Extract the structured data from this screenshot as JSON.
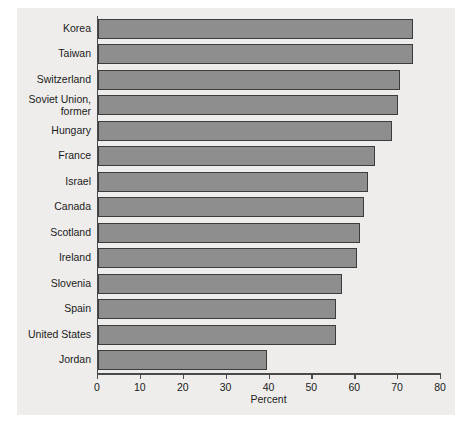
{
  "chart_data": {
    "type": "bar",
    "orientation": "horizontal",
    "title": "",
    "xlabel": "Percent",
    "ylabel": "",
    "xlim": [
      0,
      80
    ],
    "xticks": [
      0,
      10,
      20,
      30,
      40,
      50,
      60,
      70,
      80
    ],
    "grid": false,
    "legend": null,
    "categories": [
      "Korea",
      "Taiwan",
      "Switzerland",
      "Soviet Union,\nformer",
      "Hungary",
      "France",
      "Israel",
      "Canada",
      "Scotland",
      "Ireland",
      "Slovenia",
      "Spain",
      "United States",
      "Jordan"
    ],
    "values": [
      73.5,
      73.5,
      70.5,
      70,
      68.5,
      64.5,
      63,
      62,
      61,
      60.5,
      57,
      55.5,
      55.5,
      39.5
    ],
    "colors": {
      "bar_fill": "#8e8e8e",
      "bar_edge": "#3c3c3c",
      "panel_background": "#eeedeb",
      "axis": "#4a4a4a",
      "text": "#1b1b1b",
      "page_background": "#ffffff"
    }
  }
}
